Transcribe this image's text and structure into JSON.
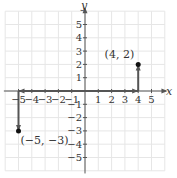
{
  "chart_data": {
    "type": "scatter",
    "title": "",
    "xlabel": "x",
    "ylabel": "y",
    "xlim": [
      -5.5,
      5.5
    ],
    "ylim": [
      -5.5,
      5.5
    ],
    "grid": true,
    "x_ticks": [
      "-5",
      "-4",
      "-3",
      "-2",
      "-1",
      "1",
      "2",
      "3",
      "4",
      "5"
    ],
    "y_ticks": [
      "5",
      "4",
      "3",
      "2",
      "1",
      "-1",
      "-2",
      "-3",
      "-4",
      "-5"
    ],
    "points": [
      {
        "x": 4,
        "y": 2,
        "label": "(4, 2)"
      },
      {
        "x": -5,
        "y": -3,
        "label": "(−5, −3)"
      }
    ],
    "arrows": [
      {
        "from": [
          0,
          0
        ],
        "to": [
          4,
          0
        ],
        "description": "move 4 right"
      },
      {
        "from": [
          4,
          0
        ],
        "to": [
          4,
          2
        ],
        "description": "move 2 up"
      },
      {
        "from": [
          0,
          0
        ],
        "to": [
          -5,
          0
        ],
        "description": "move 5 left"
      },
      {
        "from": [
          -5,
          0
        ],
        "to": [
          -5,
          -3
        ],
        "description": "move 3 down"
      }
    ],
    "colors": {
      "grid": "#e6e6e6",
      "axis": "#555555",
      "arrow": "#555555",
      "point": "#111111"
    }
  }
}
